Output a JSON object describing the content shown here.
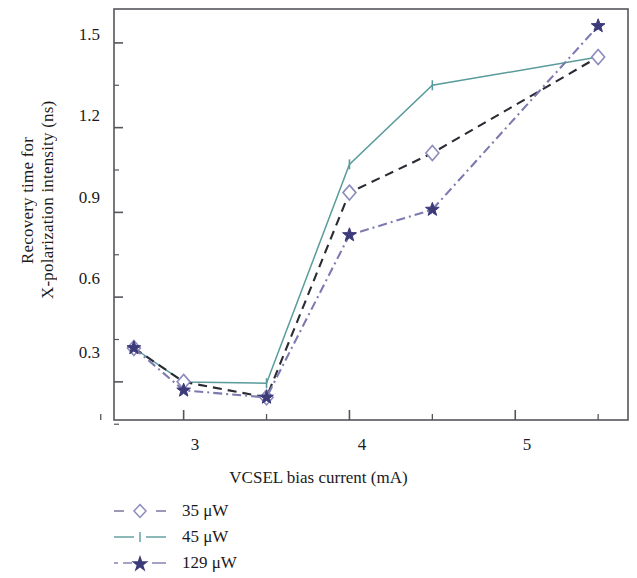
{
  "chart_data": {
    "type": "line",
    "title": "",
    "xlabel": "VCSEL bias current (mA)",
    "ylabel_line1": "Recovery time for",
    "ylabel_line2": "X-polarization intensity (ns)",
    "xlim": [
      2.58,
      5.68
    ],
    "ylim": [
      0.165,
      1.62
    ],
    "xticks": [
      3,
      4,
      5
    ],
    "xtick_labels": [
      "3",
      "4",
      "5"
    ],
    "xminor_ticks": [
      2.5,
      3.5,
      4.5,
      5.5
    ],
    "yticks": [
      0.3,
      0.6,
      0.9,
      1.2,
      1.5
    ],
    "ytick_labels": [
      "0.3",
      "0.6",
      "0.9",
      "1.2",
      "1.5"
    ],
    "yminor_ticks": [
      0.15,
      0.45,
      0.75,
      1.05,
      1.35
    ],
    "grid": false,
    "legend_position": "below-left",
    "x": [
      2.7,
      3.0,
      3.5,
      4.0,
      4.5,
      5.5
    ],
    "series": [
      {
        "name": "35 μW",
        "label": "35 μW",
        "color": "#8b8bbd",
        "line_color": "#2b2b33",
        "linestyle": "dashed",
        "marker": "open-diamond",
        "values": [
          0.42,
          0.3,
          0.245,
          0.97,
          1.11,
          1.45
        ]
      },
      {
        "name": "45 μW",
        "label": "45 μW",
        "color": "#5a9b9b",
        "line_color": "#5a9b9b",
        "linestyle": "dash-dot",
        "marker": "tick",
        "values": [
          0.42,
          0.3,
          0.295,
          1.07,
          1.35,
          1.45
        ]
      },
      {
        "name": "129 μW",
        "label": "129 μW",
        "color": "#3d3a7a",
        "line_color": "#7d7ab0",
        "linestyle": "dash-dot",
        "marker": "filled-star",
        "values": [
          0.42,
          0.27,
          0.245,
          0.82,
          0.91,
          1.56
        ]
      }
    ]
  },
  "legend": {
    "items": [
      {
        "label": "35 μW"
      },
      {
        "label": "45 μW"
      },
      {
        "label": "129 μW"
      }
    ]
  },
  "axes": {
    "frame_color": "#55555c"
  }
}
